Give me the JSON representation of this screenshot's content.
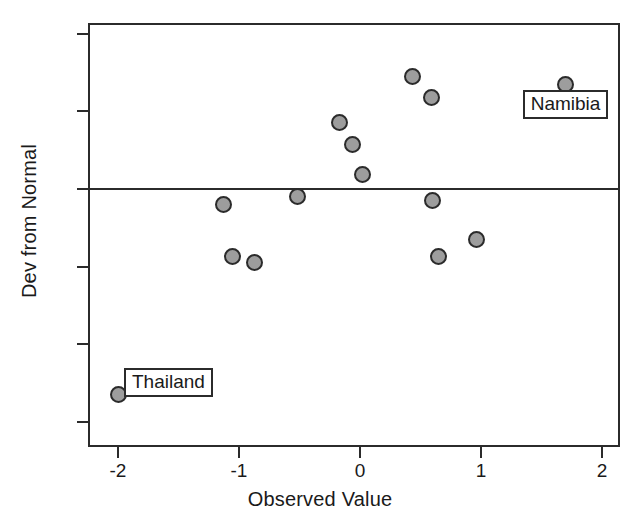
{
  "chart_data": {
    "type": "scatter",
    "title": "",
    "xlabel": "Observed Value",
    "ylabel": "Dev from Normal",
    "xlim": [
      -2.3,
      2.17
    ],
    "ylim": [
      -0.69,
      0.48
    ],
    "grid": false,
    "legend": null,
    "reference_lines": [
      {
        "axis": "y",
        "value": 0.0
      }
    ],
    "xticks": [
      -2,
      -1,
      0,
      1,
      2
    ],
    "xtick_labels": [
      "-2",
      "-1",
      "0",
      "1",
      "2"
    ],
    "yticks": [
      0.4,
      0.2,
      0.0,
      -0.2,
      -0.4,
      -0.6
    ],
    "ytick_labels": [
      "0.4",
      "0.2",
      "0.0",
      "-0.2",
      "-0.4",
      "-0.6"
    ],
    "marker_color": "#9d9d9d",
    "marker_edge_color": "#2b2b2b",
    "points": [
      {
        "x": -2.0,
        "y": -0.53,
        "label": "Thailand"
      },
      {
        "x": -1.13,
        "y": -0.04,
        "label": ""
      },
      {
        "x": -1.05,
        "y": -0.175,
        "label": ""
      },
      {
        "x": -0.87,
        "y": -0.19,
        "label": ""
      },
      {
        "x": -0.52,
        "y": -0.02,
        "label": ""
      },
      {
        "x": -0.17,
        "y": 0.17,
        "label": ""
      },
      {
        "x": -0.06,
        "y": 0.115,
        "label": ""
      },
      {
        "x": 0.02,
        "y": 0.037,
        "label": ""
      },
      {
        "x": 0.43,
        "y": 0.29,
        "label": ""
      },
      {
        "x": 0.59,
        "y": 0.235,
        "label": ""
      },
      {
        "x": 0.6,
        "y": -0.03,
        "label": ""
      },
      {
        "x": 0.65,
        "y": -0.175,
        "label": ""
      },
      {
        "x": 0.96,
        "y": -0.13,
        "label": ""
      },
      {
        "x": 1.7,
        "y": 0.27,
        "label": "Namibia"
      }
    ],
    "annotations": [
      {
        "text": "Thailand",
        "point_x": -2.0,
        "point_y": -0.53,
        "placement": "upper-right"
      },
      {
        "text": "Namibia",
        "point_x": 1.7,
        "point_y": 0.27,
        "placement": "below-center"
      }
    ]
  }
}
